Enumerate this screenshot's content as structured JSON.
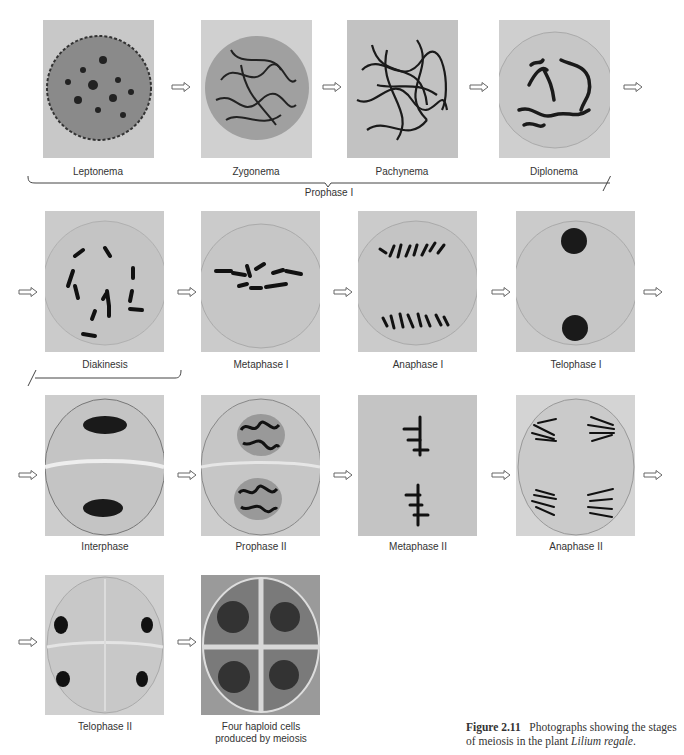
{
  "figure": {
    "number_label": "Figure 2.11",
    "caption_text": "Photographs showing the stages of meiosis in the plant",
    "caption_species": "Lilium regale",
    "caption_end": "."
  },
  "stages": [
    {
      "label": "Leptonema"
    },
    {
      "label": "Zygonema"
    },
    {
      "label": "Pachynema"
    },
    {
      "label": "Diplonema"
    },
    {
      "label": "Diakinesis"
    },
    {
      "label": "Metaphase I"
    },
    {
      "label": "Anaphase I"
    },
    {
      "label": "Telophase I"
    },
    {
      "label": "Interphase"
    },
    {
      "label": "Prophase II"
    },
    {
      "label": "Metaphase II"
    },
    {
      "label": "Anaphase II"
    },
    {
      "label": "Telophase II"
    },
    {
      "label_line1": "Four haploid cells",
      "label_line2": "produced by meiosis"
    }
  ],
  "group_label": "Prophase I",
  "icons": {
    "arrow": "hollow-right-arrow-icon"
  },
  "colors": {
    "panel_bg": "#c9c9c9",
    "chromosome": "#1a1a1a",
    "text": "#333333"
  }
}
